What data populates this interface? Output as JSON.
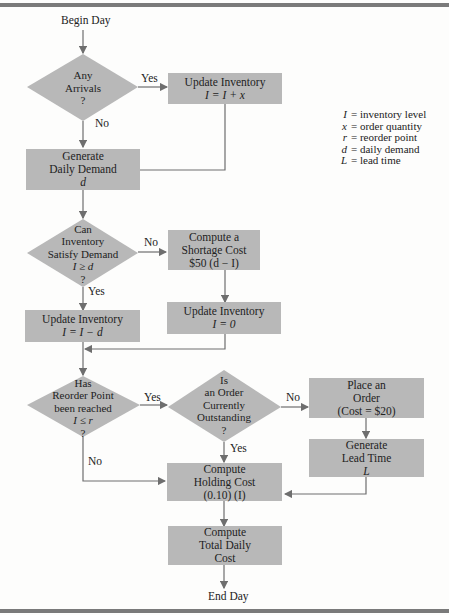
{
  "flowchart": {
    "start": "Begin Day",
    "end": "End Day",
    "nodes": {
      "any_arrivals": {
        "type": "decision",
        "lines": [
          "Any",
          "Arrivals",
          "?"
        ]
      },
      "update_inv_arrival": {
        "type": "process",
        "lines": [
          "Update Inventory",
          "I = I + x"
        ]
      },
      "generate_demand": {
        "type": "process",
        "lines": [
          "Generate",
          "Daily Demand",
          "d"
        ]
      },
      "can_satisfy": {
        "type": "decision",
        "lines": [
          "Can",
          "Inventory",
          "Satisfy Demand",
          "I ≥ d",
          "?"
        ]
      },
      "shortage_cost": {
        "type": "process",
        "lines": [
          "Compute a",
          "Shortage Cost",
          "$50 (d − I)"
        ]
      },
      "update_inv_demand": {
        "type": "process",
        "lines": [
          "Update Inventory",
          "I = I − d"
        ]
      },
      "update_inv_zero": {
        "type": "process",
        "lines": [
          "Update Inventory",
          "I = 0"
        ]
      },
      "reorder_reached": {
        "type": "decision",
        "lines": [
          "Has",
          "Reorder Point",
          "been reached",
          "I ≤ r",
          "?"
        ]
      },
      "order_outstanding": {
        "type": "decision",
        "lines": [
          "Is",
          "an Order",
          "Currently",
          "Outstanding",
          "?"
        ]
      },
      "place_order": {
        "type": "process",
        "lines": [
          "Place an",
          "Order",
          "(Cost = $20)"
        ]
      },
      "generate_lead_time": {
        "type": "process",
        "lines": [
          "Generate",
          "Lead Time",
          "L"
        ]
      },
      "holding_cost": {
        "type": "process",
        "lines": [
          "Compute",
          "Holding Cost",
          "(0.10) (I)"
        ]
      },
      "total_cost": {
        "type": "process",
        "lines": [
          "Compute",
          "Total Daily",
          "Cost"
        ]
      }
    },
    "edge_labels": {
      "arrivals_yes": "Yes",
      "arrivals_no": "No",
      "satisfy_no": "No",
      "satisfy_yes": "Yes",
      "reorder_yes": "Yes",
      "reorder_no": "No",
      "outstanding_no": "No",
      "outstanding_yes": "Yes"
    }
  },
  "legend": [
    {
      "symbol": "I",
      "meaning": "= inventory level"
    },
    {
      "symbol": "x",
      "meaning": "= order quantity"
    },
    {
      "symbol": "r",
      "meaning": "= reorder point"
    },
    {
      "symbol": "d",
      "meaning": "= daily demand"
    },
    {
      "symbol": "L",
      "meaning": "= lead time"
    }
  ],
  "colors": {
    "shape_fill": "#b8b8b8",
    "line": "#6e6e6e",
    "rule": "#7a7a7a"
  }
}
